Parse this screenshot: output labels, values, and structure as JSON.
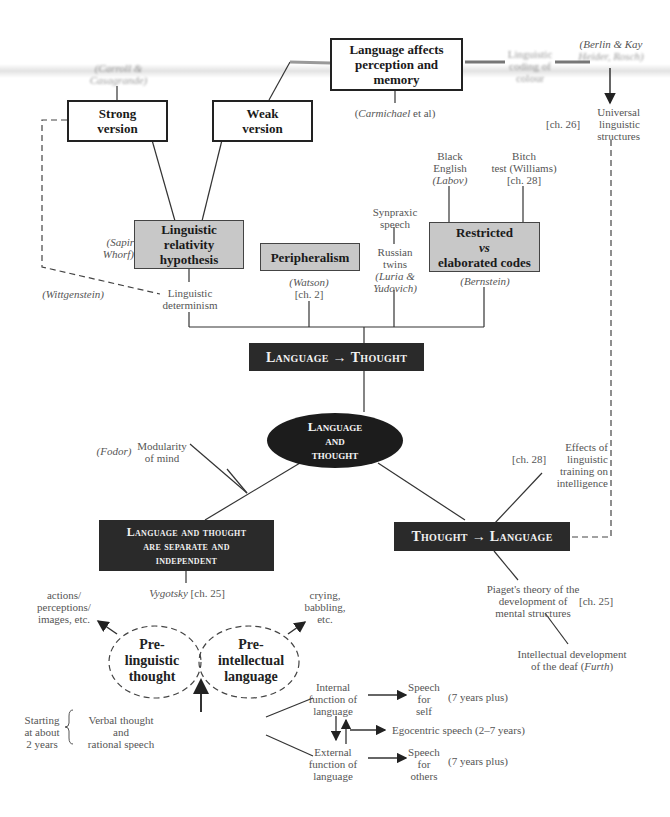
{
  "diagram": {
    "title": "Language and Thought",
    "center": {
      "line1": "Language",
      "line2": "and",
      "line3": "thought"
    },
    "top_nodes": {
      "affects": {
        "line1": "Language affects",
        "line2": "perception and",
        "line3": "memory"
      },
      "strong": {
        "line1": "Strong",
        "line2": "version"
      },
      "weak": {
        "line1": "Weak",
        "line2": "version"
      },
      "carroll": {
        "line1": "(Carroll &",
        "line2": "Casagrande)"
      },
      "carmichael": {
        "name": "Carmichael",
        "rest": " et al)",
        "open": "("
      },
      "colour": {
        "line1": "Linguistic",
        "line2": "coding of",
        "line3": "colour"
      },
      "berlin": {
        "line1": "(Berlin & Kay",
        "line2": "Heider, Rosch)"
      },
      "universal": {
        "line1": "Universal",
        "line2": "linguistic",
        "line3": "structures",
        "ch": "[ch. 26]"
      }
    },
    "lt_branch": {
      "hypothesis": {
        "line1": "Linguistic",
        "line2": "relativity",
        "line3": "hypothesis"
      },
      "sapir": {
        "line1": "(Sapir",
        "line2": "Whorf)"
      },
      "peripheralism": "Peripheralism",
      "watson": {
        "line1": "(Watson)",
        "line2": "[ch. 2]"
      },
      "restricted": {
        "line1": "Restricted",
        "line2": "vs",
        "line3": "elaborated codes"
      },
      "bernstein": "(Bernstein)",
      "black_english": {
        "line1": "Black",
        "line2": "English",
        "line3": "(Labov)"
      },
      "bitch": {
        "line1": "Bitch",
        "line2": "test (Williams)",
        "line3": "[ch. 28]"
      },
      "synpraxic": {
        "line1": "Synpraxic",
        "line2": "speech"
      },
      "twins": {
        "line1": "Russian",
        "line2": "twins",
        "line3": "(Luria &",
        "line4": "Yudovich)"
      },
      "wittgenstein": "(Wittgenstein)",
      "determinism": {
        "line1": "Linguistic",
        "line2": "determinism"
      },
      "box": {
        "left": "Language",
        "arrow": "→",
        "right": "Thought"
      }
    },
    "left_branch": {
      "fodor": "(Fodor)",
      "modularity": {
        "line1": "Modularity",
        "line2": "of mind"
      },
      "box": {
        "line1": "Language and thought",
        "line2": "are separate and",
        "line3": "independent"
      },
      "vygotsky": {
        "name": "Vygotsky",
        "ch": " [ch. 25]"
      },
      "actions": {
        "line1": "actions/",
        "line2": "perceptions/",
        "line3": "images, etc."
      },
      "crying": {
        "line1": "crying,",
        "line2": "babbling,",
        "line3": "etc."
      },
      "prelinguistic": {
        "line1": "Pre-",
        "line2": "linguistic",
        "line3": "thought"
      },
      "preintellectual": {
        "line1": "Pre-",
        "line2": "intellectual",
        "line3": "language"
      },
      "starting": {
        "line1": "Starting",
        "line2": "at about",
        "line3": "2 years"
      },
      "verbal": {
        "line1": "Verbal thought",
        "line2": "and",
        "line3": "rational speech"
      },
      "internal": {
        "line1": "Internal",
        "line2": "function of",
        "line3": "language"
      },
      "external": {
        "line1": "External",
        "line2": "function of",
        "line3": "language"
      },
      "speech_self": {
        "line1": "Speech",
        "line2": "for",
        "line3": "self"
      },
      "speech_others": {
        "line1": "Speech",
        "line2": "for",
        "line3": "others"
      },
      "plus1": "(7 years plus)",
      "plus2": "(7 years plus)",
      "egocentric": "Egocentric speech (2–7 years)"
    },
    "right_branch": {
      "box": {
        "left": "Thought",
        "arrow": "→",
        "right": "Language"
      },
      "effects": {
        "line1": "Effects of",
        "line2": "linguistic",
        "line3": "training on",
        "line4": "intelligence",
        "ch": "[ch. 28]"
      },
      "piaget": {
        "line1": "Piaget's theory of the",
        "line2": "development of",
        "line3": "mental structures",
        "ch": "[ch. 25]"
      },
      "deaf": {
        "line1": "Intellectual development",
        "line2": "of the deaf (",
        "name": "Furth",
        "close": ")"
      }
    }
  }
}
